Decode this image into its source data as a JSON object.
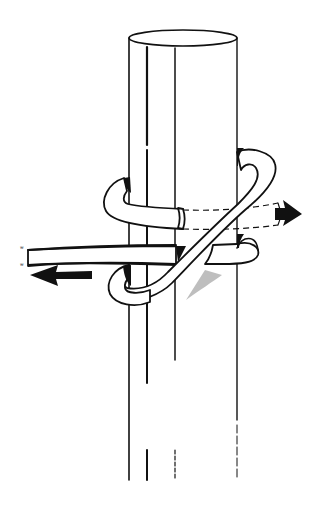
{
  "figure": {
    "subject": "Rope knot tied around a vertical pole",
    "caption": "",
    "colors": {
      "line": "#111111",
      "background": "#ffffff"
    },
    "elements": {
      "pole": "vertical cylindrical post",
      "rope": "rope wrapped around the pole forming a hitch",
      "pull_arrow_left": "arrow pointing left along standing rope",
      "pull_arrow_right": "arrow pointing right from rope end behind the pole",
      "rope_end_marks": "small tick marks at left rope ends"
    }
  }
}
